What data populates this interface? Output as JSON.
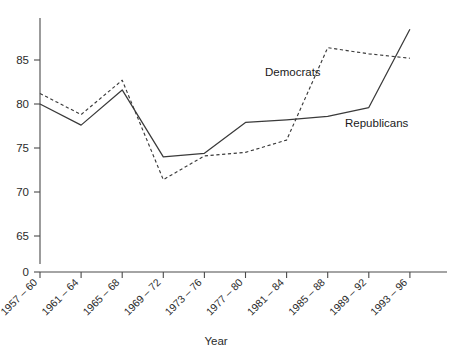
{
  "chart_data": {
    "type": "line",
    "title": "",
    "xlabel": "Year",
    "ylabel": "",
    "categories": [
      "1957 – 60",
      "1961 – 64",
      "1965 – 68",
      "1969 – 72",
      "1973 – 76",
      "1977 – 80",
      "1981 – 84",
      "1985 – 88",
      "1989 – 92",
      "1993 – 96"
    ],
    "series": [
      {
        "name": "Republicans",
        "style": "solid",
        "values": [
          80.0,
          77.6,
          81.6,
          74.0,
          74.4,
          77.9,
          78.2,
          78.6,
          79.6,
          88.5
        ]
      },
      {
        "name": "Democrats",
        "style": "dashed",
        "values": [
          81.2,
          78.8,
          82.7,
          71.4,
          74.1,
          74.5,
          75.9,
          86.4,
          85.7,
          85.2
        ]
      }
    ],
    "ytick_labels": [
      "85",
      "80",
      "75",
      "70",
      "65",
      "0"
    ],
    "ytick_values": [
      85,
      80,
      75,
      70,
      65,
      0
    ],
    "ylim": [
      65,
      89
    ],
    "axis_break": true,
    "grid": false,
    "legend_position": "inline-annotations",
    "annotations": [
      {
        "text": "Democrats",
        "x": 265,
        "y": 72
      },
      {
        "text": "Republicans",
        "x": 345,
        "y": 123
      }
    ],
    "colors": {
      "line": "#3a3a3a",
      "axis": "#4a4a4a",
      "text": "#2b2b2b",
      "background": "#ffffff"
    }
  }
}
